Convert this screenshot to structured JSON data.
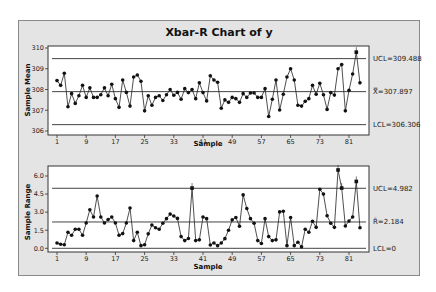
{
  "chart_data": [
    {
      "type": "line",
      "title": "Xbar-R Chart of y",
      "subplot": "xbar",
      "xlabel": "Sample",
      "ylabel": "Sample Mean",
      "xticks": [
        1,
        9,
        17,
        25,
        33,
        41,
        49,
        57,
        65,
        73,
        81
      ],
      "yticks": [
        "306",
        "307",
        "308",
        "309",
        "310"
      ],
      "ylim": [
        306,
        310
      ],
      "xlim": [
        1,
        84
      ],
      "grid": false,
      "control_lines": [
        {
          "name": "UCL",
          "value": 309.488,
          "label": "UCL=309.488"
        },
        {
          "name": "center",
          "value": 307.897,
          "label": "X̿=307.897"
        },
        {
          "name": "LCL",
          "value": 306.306,
          "label": "LCL=306.306"
        }
      ],
      "x": [
        1,
        2,
        3,
        4,
        5,
        6,
        7,
        8,
        9,
        10,
        11,
        12,
        13,
        14,
        15,
        16,
        17,
        18,
        19,
        20,
        21,
        22,
        23,
        24,
        25,
        26,
        27,
        28,
        29,
        30,
        31,
        32,
        33,
        34,
        35,
        36,
        37,
        38,
        39,
        40,
        41,
        42,
        43,
        44,
        45,
        46,
        47,
        48,
        49,
        50,
        51,
        52,
        53,
        54,
        55,
        56,
        57,
        58,
        59,
        60,
        61,
        62,
        63,
        64,
        65,
        66,
        67,
        68,
        69,
        70,
        71,
        72,
        73,
        74,
        75,
        76,
        77,
        78,
        79,
        80,
        81,
        82,
        83,
        84
      ],
      "values": [
        308.43,
        308.2,
        308.78,
        307.17,
        307.8,
        307.33,
        307.7,
        308.2,
        307.62,
        308.08,
        307.62,
        307.62,
        307.75,
        308.08,
        307.7,
        308.25,
        307.56,
        307.14,
        308.46,
        307.86,
        307.2,
        308.6,
        308.7,
        308.4,
        306.97,
        307.7,
        307.24,
        307.62,
        307.7,
        307.47,
        307.75,
        308.0,
        307.72,
        307.86,
        307.53,
        308.04,
        307.85,
        308.0,
        307.56,
        308.32,
        307.85,
        307.45,
        308.66,
        308.46,
        308.35,
        307.1,
        307.5,
        307.38,
        307.62,
        307.56,
        307.38,
        307.8,
        307.62,
        307.83,
        307.83,
        307.62,
        307.62,
        308.04,
        306.7,
        307.53,
        308.46,
        307.01,
        307.77,
        308.6,
        309.0,
        308.46,
        307.24,
        307.2,
        307.43,
        307.56,
        308.2,
        307.77,
        308.3,
        307.75,
        307.04,
        307.85,
        307.73,
        309.0,
        309.2,
        306.97,
        307.96,
        308.75,
        309.8,
        308.32
      ],
      "flagged": [
        83
      ]
    },
    {
      "type": "line",
      "subplot": "range",
      "xlabel": "Sample",
      "ylabel": "Sample Range",
      "xticks": [
        1,
        9,
        17,
        25,
        33,
        41,
        49,
        57,
        65,
        73,
        81
      ],
      "yticks": [
        "0.0",
        "1.5",
        "3.0",
        "4.5",
        "6.0"
      ],
      "ylim": [
        0,
        6.8
      ],
      "xlim": [
        1,
        84
      ],
      "grid": false,
      "control_lines": [
        {
          "name": "UCL",
          "value": 4.982,
          "label": "UCL=4.982"
        },
        {
          "name": "center",
          "value": 2.184,
          "label": "R̄=2.184"
        },
        {
          "name": "LCL",
          "value": 0,
          "label": "LCL=0"
        }
      ],
      "x": [
        1,
        2,
        3,
        4,
        5,
        6,
        7,
        8,
        9,
        10,
        11,
        12,
        13,
        14,
        15,
        16,
        17,
        18,
        19,
        20,
        21,
        22,
        23,
        24,
        25,
        26,
        27,
        28,
        29,
        30,
        31,
        32,
        33,
        34,
        35,
        36,
        37,
        38,
        39,
        40,
        41,
        42,
        43,
        44,
        45,
        46,
        47,
        48,
        49,
        50,
        51,
        52,
        53,
        54,
        55,
        56,
        57,
        58,
        59,
        60,
        61,
        62,
        63,
        64,
        65,
        66,
        67,
        68,
        69,
        70,
        71,
        72,
        73,
        74,
        75,
        76,
        77,
        78,
        79,
        80,
        81,
        82,
        83,
        84
      ],
      "values": [
        0.44,
        0.33,
        0.3,
        1.33,
        1.08,
        1.58,
        1.58,
        1.08,
        2.1,
        3.2,
        2.6,
        4.34,
        2.6,
        2.1,
        2.38,
        2.6,
        2.1,
        1.08,
        1.22,
        2.1,
        3.34,
        0.64,
        1.33,
        0.22,
        0.3,
        1.2,
        1.93,
        1.7,
        1.58,
        2.08,
        2.46,
        2.84,
        2.68,
        2.48,
        0.97,
        0.64,
        0.81,
        5.0,
        0.64,
        0.7,
        2.6,
        2.46,
        0.28,
        0.44,
        0.22,
        0.44,
        0.8,
        1.5,
        2.36,
        2.55,
        1.83,
        4.43,
        3.3,
        2.46,
        2.08,
        0.64,
        0.4,
        2.46,
        0.97,
        0.64,
        0.7,
        3.02,
        3.08,
        0.22,
        2.55,
        0.22,
        0.5,
        0.12,
        1.58,
        1.33,
        2.24,
        1.74,
        4.9,
        4.5,
        2.7,
        2.08,
        1.74,
        6.5,
        5.0,
        1.85,
        2.27,
        2.6,
        5.55,
        1.7
      ],
      "flagged": [
        38,
        78,
        79,
        83
      ]
    }
  ]
}
